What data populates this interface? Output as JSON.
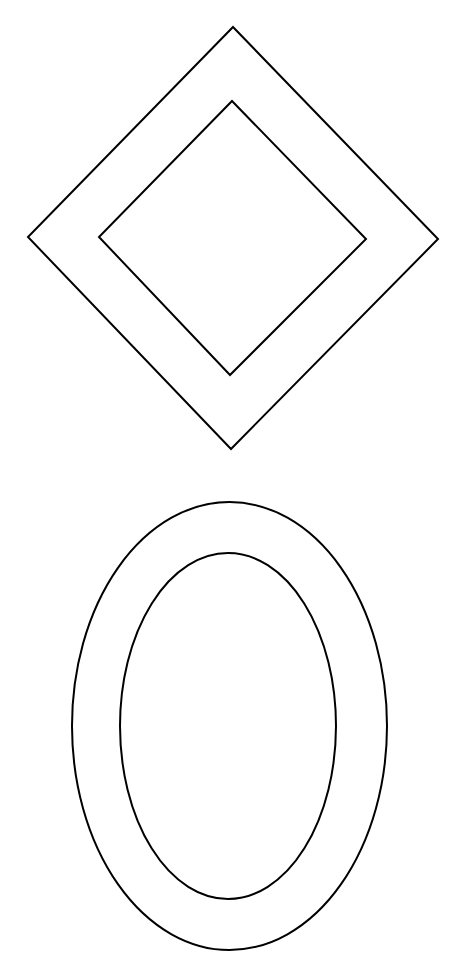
{
  "canvas": {
    "width": 463,
    "height": 961,
    "background": "#ffffff"
  },
  "stroke": {
    "color": "#000000",
    "width": 2
  },
  "shapes": {
    "diamond_outer": {
      "points": "233,27 438,239 231,449 28,237"
    },
    "diamond_inner": {
      "points": "232,101 366,239 230,375 99,237"
    },
    "ellipse_outer": {
      "cx": 229.5,
      "cy": 726,
      "rx": 157.5,
      "ry": 224
    },
    "ellipse_inner": {
      "cx": 228,
      "cy": 726,
      "rx": 108,
      "ry": 173
    }
  }
}
